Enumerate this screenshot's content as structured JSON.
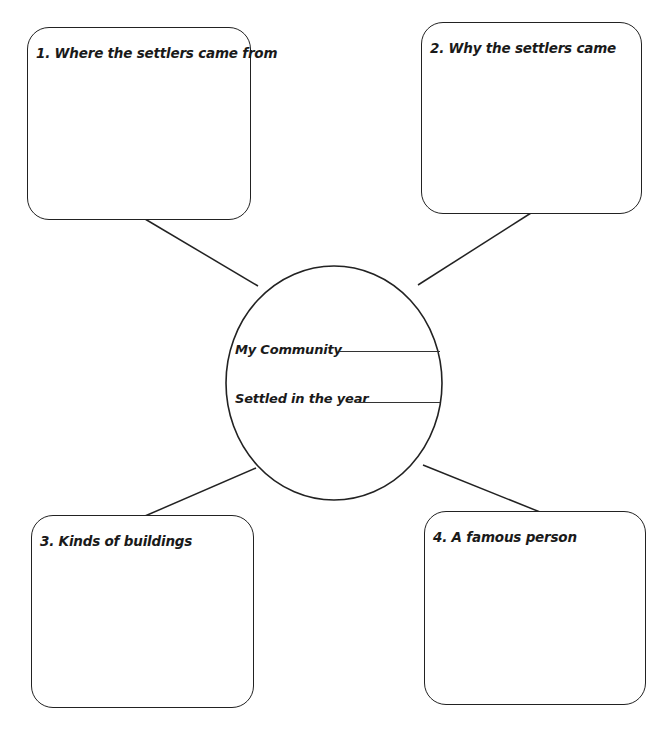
{
  "diagram": {
    "type": "web-organizer",
    "center": {
      "fields": [
        {
          "label": "My Community",
          "value": ""
        },
        {
          "label": "Settled in the year",
          "value": ""
        }
      ]
    },
    "boxes": [
      {
        "id": 1,
        "label": "1. Where the settlers came from",
        "content": ""
      },
      {
        "id": 2,
        "label": "2. Why the settlers came",
        "content": ""
      },
      {
        "id": 3,
        "label": "3. Kinds of buildings",
        "content": ""
      },
      {
        "id": 4,
        "label": "4. A famous person",
        "content": ""
      }
    ],
    "colors": {
      "stroke": "#222222",
      "background": "#ffffff",
      "text": "#1a1a1a"
    }
  }
}
